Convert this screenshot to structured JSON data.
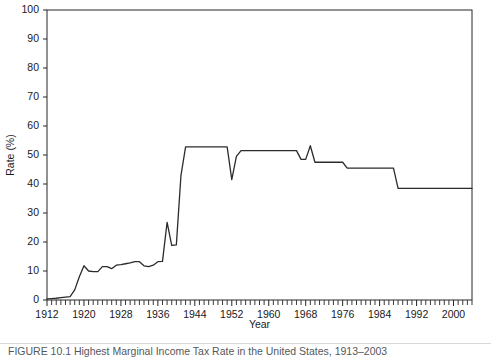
{
  "chart_data": {
    "type": "line",
    "title": "",
    "xlabel": "Year",
    "ylabel": "Rate (%)",
    "xlim": [
      1912,
      2004
    ],
    "ylim": [
      0,
      100
    ],
    "grid": false,
    "legend": "none",
    "y_ticks": [
      0,
      10,
      20,
      30,
      40,
      50,
      60,
      70,
      80,
      90,
      100
    ],
    "x_ticks_labeled": [
      1912,
      1920,
      1928,
      1936,
      1944,
      1952,
      1960,
      1968,
      1976,
      1984,
      1992,
      2000
    ],
    "x_tick_step_minor": 1,
    "series": [
      {
        "name": "Rate",
        "color": "#2b2b2b",
        "x": [
          1912,
          1913,
          1914,
          1915,
          1916,
          1917,
          1918,
          1919,
          1920,
          1921,
          1922,
          1923,
          1924,
          1925,
          1926,
          1927,
          1928,
          1929,
          1930,
          1931,
          1932,
          1933,
          1934,
          1935,
          1936,
          1937,
          1938,
          1939,
          1940,
          1941,
          1942,
          1943,
          1944,
          1945,
          1946,
          1947,
          1948,
          1949,
          1950,
          1951,
          1952,
          1953,
          1954,
          1955,
          1956,
          1957,
          1958,
          1959,
          1960,
          1961,
          1962,
          1963,
          1964,
          1965,
          1966,
          1967,
          1968,
          1969,
          1970,
          1971,
          1972,
          1973,
          1974,
          1975,
          1976,
          1977,
          1978,
          1979,
          1980,
          1981,
          1982,
          1983,
          1984,
          1985,
          1986,
          1987,
          1988,
          1989,
          1990,
          1991,
          1992,
          1993,
          1994,
          1995,
          1996,
          1997,
          1998,
          1999,
          2000,
          2001,
          2002,
          2003,
          2004
        ],
        "y": [
          0.4,
          0.5,
          0.6,
          0.8,
          1.0,
          1.2,
          3.5,
          8.0,
          11.8,
          10.0,
          9.8,
          9.8,
          11.5,
          11.5,
          10.8,
          12.0,
          12.2,
          12.5,
          12.8,
          13.2,
          13.2,
          11.8,
          11.5,
          12.0,
          13.2,
          13.3,
          26.8,
          18.8,
          19.0,
          43.0,
          52.8,
          52.8,
          52.8,
          52.8,
          52.8,
          52.8,
          52.8,
          52.8,
          52.8,
          52.8,
          41.5,
          49.5,
          51.5,
          51.5,
          51.5,
          51.5,
          51.5,
          51.5,
          51.5,
          51.5,
          51.5,
          51.5,
          51.5,
          51.5,
          51.5,
          48.5,
          48.5,
          53.2,
          47.5,
          47.5,
          47.5,
          47.5,
          47.5,
          47.5,
          47.5,
          45.5,
          45.5,
          45.5,
          45.5,
          45.5,
          45.5,
          45.5,
          45.5,
          45.5,
          45.5,
          45.5,
          38.5,
          38.5,
          38.5,
          38.5,
          38.5,
          38.5,
          38.5,
          38.5,
          38.5,
          38.5,
          38.5,
          38.5,
          38.5,
          38.5,
          38.5,
          38.5,
          38.5
        ]
      }
    ]
  },
  "caption": {
    "text": "FIGURE 10.1   Highest Marginal Income Tax Rate in the United States, 1913–2003"
  }
}
